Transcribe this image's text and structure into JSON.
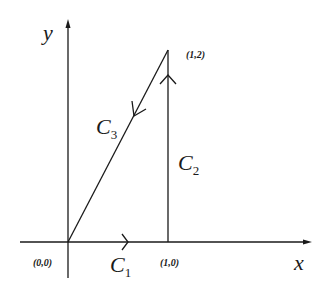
{
  "diagram": {
    "axes": {
      "x_label": "x",
      "y_label": "y"
    },
    "points": [
      {
        "id": "origin",
        "label": "(0,0)"
      },
      {
        "id": "p10",
        "label": "(1,0)"
      },
      {
        "id": "p12",
        "label": "(1,2)"
      }
    ],
    "curves": [
      {
        "id": "c1",
        "name": "C",
        "sub": "1",
        "from": "(0,0)",
        "to": "(1,0)"
      },
      {
        "id": "c2",
        "name": "C",
        "sub": "2",
        "from": "(1,0)",
        "to": "(1,2)"
      },
      {
        "id": "c3",
        "name": "C",
        "sub": "3",
        "from": "(1,2)",
        "to": "(0,0)"
      }
    ],
    "colors": {
      "stroke": "#1a1a1a",
      "background": "#ffffff"
    }
  }
}
